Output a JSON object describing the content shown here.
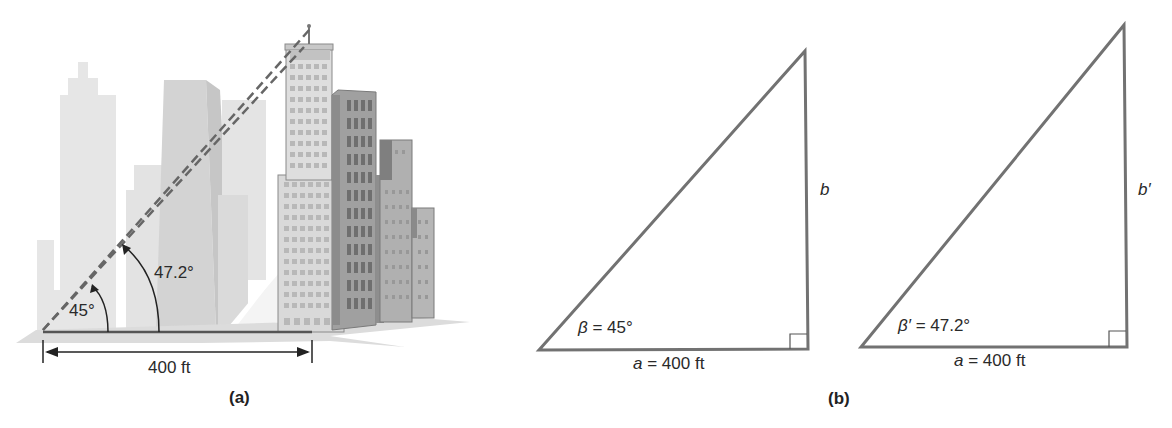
{
  "panel_a": {
    "caption": "(a)",
    "angle_small": "45°",
    "angle_large": "47.2°",
    "distance": "400 ft"
  },
  "panel_b": {
    "caption": "(b)",
    "triangle1": {
      "angle": "β = 45°",
      "base": "a = 400 ft",
      "base_var": "a",
      "base_val": " = 400 ft",
      "angle_var": "β",
      "angle_val": " = 45°",
      "side": "b"
    },
    "triangle2": {
      "angle": "β′ = 47.2°",
      "angle_var": "β′",
      "angle_val": " = 47.2°",
      "base_var": "a",
      "base_val": " = 400 ft",
      "side": "b′"
    }
  },
  "colors": {
    "line": "#6e6e6e",
    "bg_buildings": "#e2e2e2",
    "mid_buildings": "#cfcfcf",
    "tower": "#d8d8d8",
    "dark_building": "#8f8f8f"
  }
}
